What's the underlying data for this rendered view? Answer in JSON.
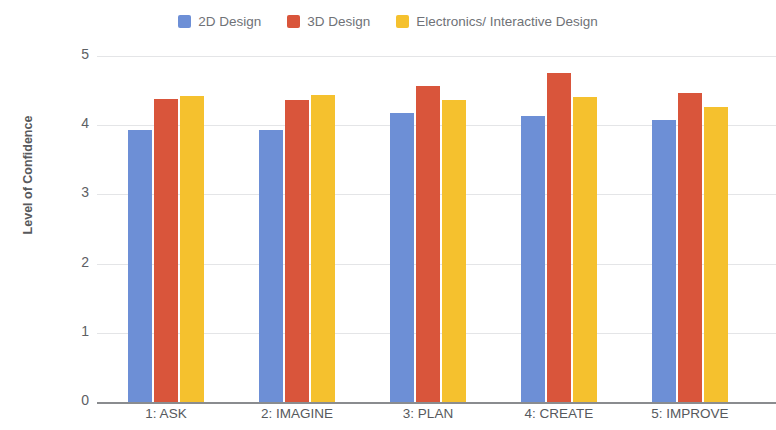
{
  "chart_data": {
    "type": "bar",
    "title": "",
    "xlabel": "",
    "ylabel": "Level of Confidence",
    "ylim": [
      0,
      5
    ],
    "yticks": [
      "0",
      "1",
      "2",
      "3",
      "4",
      "5"
    ],
    "grid": true,
    "legend_position": "top",
    "categories": [
      "1: ASK",
      "2: IMAGINE",
      "3: PLAN",
      "4: CREATE",
      "5: IMPROVE"
    ],
    "series": [
      {
        "name": "2D Design",
        "color": "#6d8fd6",
        "values": [
          3.93,
          3.93,
          4.18,
          4.14,
          4.07
        ]
      },
      {
        "name": "3D Design",
        "color": "#d9553b",
        "values": [
          4.38,
          4.37,
          4.57,
          4.75,
          4.46
        ]
      },
      {
        "name": "Electronics/ Interactive Design",
        "color": "#f5c12e",
        "values": [
          4.42,
          4.43,
          4.37,
          4.41,
          4.27
        ]
      }
    ]
  },
  "legend": {
    "items": [
      {
        "label": "2D Design",
        "color": "#6d8fd6"
      },
      {
        "label": "3D Design",
        "color": "#d9553b"
      },
      {
        "label": "Electronics/ Interactive Design",
        "color": "#f5c12e"
      }
    ]
  },
  "axes": {
    "y_title": "Level of Confidence"
  }
}
